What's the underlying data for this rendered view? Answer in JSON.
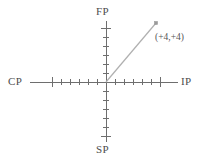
{
  "diagram": {
    "type": "coordinate-axes",
    "width": 203,
    "height": 164,
    "background_color": "#ffffff",
    "axis_color": "#6e6e6e",
    "ray_color": "#b0b0b0",
    "text_color": "#4d4d4d",
    "origin": {
      "x": 106,
      "y": 82
    },
    "axis_labels": {
      "left": "CP",
      "right": "IP",
      "top": "FP",
      "bottom": "SP"
    },
    "annotations": [
      {
        "name": "point-coordinate-label",
        "text": "(+4,+4)",
        "x": 155,
        "y": 33
      }
    ],
    "ray": {
      "from": {
        "x": 106,
        "y": 82
      },
      "to": {
        "x": 156,
        "y": 23
      },
      "endpoint_marker": "square",
      "coordinates": "(+4,+4)"
    },
    "ticks": {
      "minor_count_per_arm": 5,
      "major_index": 6,
      "spacing_px": 9,
      "minor_half_length": 3,
      "major_half_length": 5
    }
  },
  "chart_data": {
    "type": "scatter",
    "title": "",
    "xlabel": "",
    "ylabel": "",
    "axes": {
      "horizontal": {
        "negative_label": "CP",
        "positive_label": "IP"
      },
      "vertical": {
        "negative_label": "SP",
        "positive_label": "FP"
      }
    },
    "points": [
      {
        "label": "(+4,+4)",
        "x": 4,
        "y": 4
      }
    ],
    "grid": false,
    "legend": "none",
    "xlim": [
      -6,
      6
    ],
    "ylim": [
      -6,
      6
    ]
  }
}
